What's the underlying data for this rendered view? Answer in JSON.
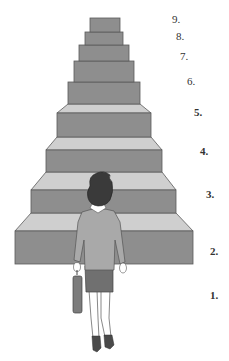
{
  "diagram": {
    "type": "staircase",
    "colors": {
      "step_front": "#8e8e8e",
      "step_top": "#cfcfcf",
      "step_edge": "#5a5a5a",
      "hair": "#3a3a3a",
      "jacket": "#a9a9a9",
      "skirt": "#707070",
      "briefcase": "#7c7c7c",
      "shoes": "#4a4a4a"
    },
    "steps": [
      {
        "label": "1.",
        "number": 1
      },
      {
        "label": "2.",
        "number": 2
      },
      {
        "label": "3.",
        "number": 3
      },
      {
        "label": "4.",
        "number": 4
      },
      {
        "label": "5.",
        "number": 5
      },
      {
        "label": "6.",
        "number": 6
      },
      {
        "label": "7.",
        "number": 7
      },
      {
        "label": "8.",
        "number": 8
      },
      {
        "label": "9.",
        "number": 9
      }
    ],
    "figure": {
      "description": "woman with briefcase standing at the bottom of the stairs, viewed from behind"
    }
  }
}
